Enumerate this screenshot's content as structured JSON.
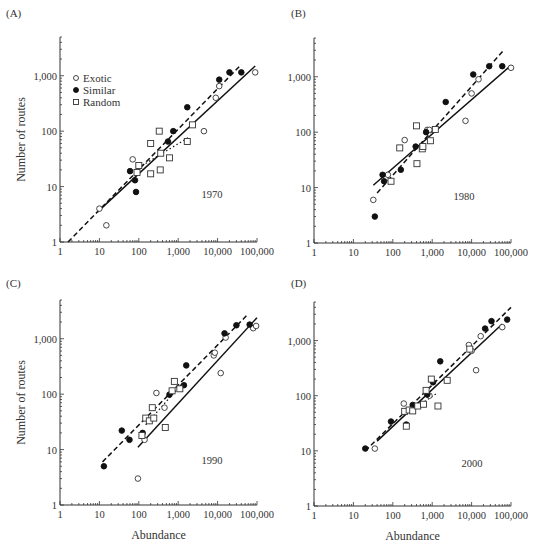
{
  "figure": {
    "y_axis_label": "Number of routes",
    "x_axis_label": "Abundance",
    "legend": [
      {
        "label": "Exotic",
        "marker": "open-circle"
      },
      {
        "label": "Similar",
        "marker": "filled-circle"
      },
      {
        "label": "Random",
        "marker": "open-square"
      }
    ],
    "x_tick_labels": [
      "1",
      "10",
      "100",
      "1,000",
      "10,000",
      "100,000"
    ],
    "y_tick_labels": [
      "1",
      "10",
      "100",
      "1,000"
    ]
  },
  "chart_data": [
    {
      "type": "scatter",
      "panel": "(A)",
      "title": "1970",
      "xlabel": "",
      "ylabel": "Number of routes",
      "xscale": "log",
      "yscale": "log",
      "xlim": [
        1,
        100000
      ],
      "ylim": [
        1,
        5000
      ],
      "legend_position": "upper-left",
      "series": [
        {
          "name": "Exotic",
          "marker": "open-circle",
          "points": [
            [
              10,
              4
            ],
            [
              15,
              2
            ],
            [
              70,
              31
            ],
            [
              9000,
              400
            ],
            [
              4500,
              100
            ],
            [
              11000,
              650
            ],
            [
              90000,
              1150
            ]
          ]
        },
        {
          "name": "Similar",
          "marker": "filled-circle",
          "points": [
            [
              60,
              19
            ],
            [
              80,
              13
            ],
            [
              85,
              8
            ],
            [
              550,
              65
            ],
            [
              750,
              100
            ],
            [
              1700,
              270
            ],
            [
              11000,
              850
            ],
            [
              20000,
              1150
            ],
            [
              40000,
              1150
            ]
          ]
        },
        {
          "name": "Random",
          "marker": "open-square",
          "points": [
            [
              90,
              18
            ],
            [
              100,
              24
            ],
            [
              200,
              60
            ],
            [
              200,
              17
            ],
            [
              330,
              100
            ],
            [
              350,
              20
            ],
            [
              360,
              40
            ],
            [
              600,
              33
            ],
            [
              1700,
              65
            ],
            [
              2300,
              130
            ]
          ]
        }
      ],
      "fits": [
        {
          "style": "dashed",
          "from": [
            1.6,
            1
          ],
          "to": [
            40000,
            1600
          ]
        },
        {
          "style": "solid",
          "from": [
            9,
            3.5
          ],
          "to": [
            90000,
            1500
          ]
        },
        {
          "style": "dotted",
          "from": [
            100,
            22
          ],
          "to": [
            2000,
            80
          ]
        }
      ]
    },
    {
      "type": "scatter",
      "panel": "(B)",
      "title": "1980",
      "xlabel": "",
      "ylabel": "",
      "xscale": "log",
      "yscale": "log",
      "xlim": [
        1,
        100000
      ],
      "ylim": [
        1,
        5000
      ],
      "series": [
        {
          "name": "Exotic",
          "marker": "open-circle",
          "points": [
            [
              32,
              6
            ],
            [
              75,
              17
            ],
            [
              200,
              72
            ],
            [
              750,
              110
            ],
            [
              850,
              110
            ],
            [
              7000,
              160
            ],
            [
              10000,
              500
            ],
            [
              15000,
              900
            ],
            [
              100000,
              1450
            ]
          ]
        },
        {
          "name": "Similar",
          "marker": "filled-circle",
          "points": [
            [
              35,
              3
            ],
            [
              55,
              17
            ],
            [
              60,
              13
            ],
            [
              160,
              21
            ],
            [
              380,
              55
            ],
            [
              700,
              100
            ],
            [
              2200,
              350
            ],
            [
              11000,
              1100
            ],
            [
              28000,
              1550
            ],
            [
              60000,
              1550
            ]
          ]
        },
        {
          "name": "Random",
          "marker": "open-square",
          "points": [
            [
              90,
              13
            ],
            [
              150,
              52
            ],
            [
              400,
              130
            ],
            [
              410,
              27
            ],
            [
              560,
              50
            ],
            [
              580,
              55
            ],
            [
              900,
              70
            ],
            [
              1200,
              112
            ]
          ]
        }
      ],
      "fits": [
        {
          "style": "dashed",
          "from": [
            40,
            8
          ],
          "to": [
            65000,
            3000
          ]
        },
        {
          "style": "solid",
          "from": [
            32,
            11
          ],
          "to": [
            100000,
            1600
          ]
        }
      ]
    },
    {
      "type": "scatter",
      "panel": "(C)",
      "title": "1990",
      "xlabel": "Abundance",
      "ylabel": "Number of routes",
      "xscale": "log",
      "yscale": "log",
      "xlim": [
        1,
        100000
      ],
      "ylim": [
        1,
        5000
      ],
      "series": [
        {
          "name": "Exotic",
          "marker": "open-circle",
          "points": [
            [
              95,
              3
            ],
            [
              140,
              15
            ],
            [
              280,
              105
            ],
            [
              450,
              57
            ],
            [
              8000,
              500
            ],
            [
              8500,
              560
            ],
            [
              12000,
              240
            ],
            [
              16000,
              1050
            ],
            [
              80000,
              1550
            ],
            [
              95000,
              1700
            ]
          ]
        },
        {
          "name": "Similar",
          "marker": "filled-circle",
          "points": [
            [
              13,
              5
            ],
            [
              37,
              22
            ],
            [
              58,
              15
            ],
            [
              125,
              20
            ],
            [
              600,
              98
            ],
            [
              1400,
              145
            ],
            [
              1600,
              330
            ],
            [
              15000,
              1250
            ],
            [
              30000,
              1750
            ],
            [
              65000,
              1800
            ]
          ]
        },
        {
          "name": "Random",
          "marker": "open-square",
          "points": [
            [
              120,
              18
            ],
            [
              150,
              37
            ],
            [
              185,
              33
            ],
            [
              220,
              57
            ],
            [
              240,
              37
            ],
            [
              470,
              25
            ],
            [
              700,
              115
            ],
            [
              800,
              170
            ],
            [
              1100,
              125
            ]
          ]
        }
      ],
      "fits": [
        {
          "style": "dashed",
          "from": [
            12,
            6
          ],
          "to": [
            60000,
            2800
          ]
        },
        {
          "style": "solid",
          "from": [
            95,
            11
          ],
          "to": [
            100000,
            2400
          ]
        },
        {
          "style": "dotted",
          "from": [
            150,
            28
          ],
          "to": [
            1300,
            160
          ]
        }
      ]
    },
    {
      "type": "scatter",
      "panel": "(D)",
      "title": "2000",
      "xlabel": "Abundance",
      "ylabel": "",
      "xscale": "log",
      "yscale": "log",
      "xlim": [
        1,
        100000
      ],
      "ylim": [
        1,
        5000
      ],
      "series": [
        {
          "name": "Exotic",
          "marker": "open-circle",
          "points": [
            [
              35,
              11
            ],
            [
              190,
              72
            ],
            [
              320,
              60
            ],
            [
              850,
              100
            ],
            [
              8500,
              830
            ],
            [
              10000,
              650
            ],
            [
              13000,
              290
            ],
            [
              17000,
              1200
            ],
            [
              60000,
              1750
            ]
          ]
        },
        {
          "name": "Similar",
          "marker": "filled-circle",
          "points": [
            [
              20,
              11
            ],
            [
              90,
              34
            ],
            [
              220,
              30
            ],
            [
              320,
              68
            ],
            [
              750,
              105
            ],
            [
              1050,
              175
            ],
            [
              1600,
              420
            ],
            [
              22000,
              1650
            ],
            [
              32000,
              2250
            ],
            [
              80000,
              2400
            ]
          ]
        },
        {
          "name": "Random",
          "marker": "open-square",
          "points": [
            [
              200,
              52
            ],
            [
              220,
              28
            ],
            [
              260,
              55
            ],
            [
              320,
              53
            ],
            [
              430,
              65
            ],
            [
              600,
              70
            ],
            [
              700,
              125
            ],
            [
              950,
              200
            ],
            [
              1400,
              65
            ],
            [
              2400,
              190
            ],
            [
              9000,
              700
            ]
          ]
        }
      ],
      "fits": [
        {
          "style": "dashed",
          "from": [
            20,
            10
          ],
          "to": [
            100000,
            4000
          ]
        },
        {
          "style": "solid",
          "from": [
            40,
            15
          ],
          "to": [
            60000,
            2000
          ]
        },
        {
          "style": "dotted",
          "from": [
            200,
            45
          ],
          "to": [
            1300,
            110
          ]
        }
      ]
    }
  ],
  "layout": {
    "panels": [
      {
        "x0": 60,
        "x1": 257,
        "y1": 242,
        "ytop": 37,
        "label_x": 6,
        "label_y": 17,
        "year_x": 212,
        "year_y": 198,
        "legend": true,
        "ylabel": true,
        "xlabel": false
      },
      {
        "x0": 314,
        "x1": 511,
        "y1": 243,
        "ytop": 38,
        "label_x": 291,
        "label_y": 17,
        "year_x": 464,
        "year_y": 200,
        "legend": false,
        "ylabel": false,
        "xlabel": false
      },
      {
        "x0": 60,
        "x1": 257,
        "y1": 505,
        "ytop": 300,
        "label_x": 6,
        "label_y": 287,
        "year_x": 212,
        "year_y": 464,
        "legend": false,
        "ylabel": true,
        "xlabel": true
      },
      {
        "x0": 314,
        "x1": 511,
        "y1": 506,
        "ytop": 302,
        "label_x": 291,
        "label_y": 287,
        "year_x": 472,
        "year_y": 467,
        "legend": false,
        "ylabel": false,
        "xlabel": true
      }
    ]
  }
}
